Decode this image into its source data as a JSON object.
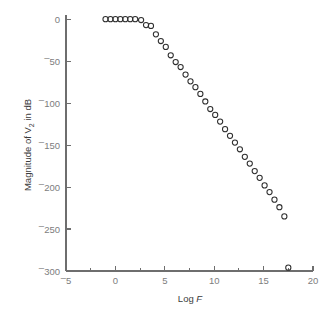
{
  "figure": {
    "background_color": "#ffffff",
    "axis_color": "#6e6e6e",
    "marker_color": "#2e2e2e",
    "tick_label_color": "#7d7d7d"
  },
  "chart_data": {
    "type": "scatter",
    "title": "",
    "xlabel": "Log F",
    "xlabel_plain": "Log",
    "xlabel_italic": "F",
    "ylabel": "Magnitude of V2 in dB",
    "ylabel_prefix": "Magnitude of V",
    "ylabel_subscript": "2",
    "ylabel_suffix": " in dB",
    "xlim": [
      -5,
      20
    ],
    "ylim": [
      -300,
      5
    ],
    "grid": false,
    "legend": false,
    "marker_style": "open-circle",
    "marker_radius_px": 2.6,
    "xticks": [
      -5,
      0,
      5,
      10,
      15,
      20
    ],
    "xtick_labels": [
      "ˉ5",
      "0",
      "5",
      "10",
      "15",
      "20"
    ],
    "xminor_ticks": [
      -2.5,
      2.5,
      7.5,
      12.5,
      17.5
    ],
    "yticks": [
      0,
      -50,
      -100,
      -150,
      -200,
      -250,
      -300
    ],
    "ytick_labels": [
      "0",
      "ˉ50",
      "ˉ100",
      "ˉ150",
      "ˉ200",
      "ˉ250",
      "ˉ300"
    ],
    "x": [
      -1.0,
      -0.5,
      0.0,
      0.5,
      1.0,
      1.5,
      2.0,
      2.6,
      3.1,
      3.6,
      4.1,
      4.6,
      5.1,
      5.6,
      6.1,
      6.6,
      7.1,
      7.6,
      8.1,
      8.6,
      9.1,
      9.6,
      10.1,
      10.6,
      11.1,
      11.6,
      12.1,
      12.6,
      13.1,
      13.6,
      14.1,
      14.6,
      15.1,
      15.6,
      16.1,
      16.6,
      17.1,
      17.5
    ],
    "y": [
      0,
      0,
      0,
      0,
      0,
      0,
      0,
      -1,
      -7,
      -8,
      -18,
      -26,
      -33,
      -43,
      -51,
      -57,
      -66,
      -74,
      -81,
      -89,
      -98,
      -107,
      -114,
      -122,
      -131,
      -139,
      -147,
      -155,
      -164,
      -172,
      -181,
      -189,
      -198,
      -206,
      -215,
      -224,
      -235,
      -296
    ],
    "series_name": "Magnitude response",
    "n_points": 38,
    "annotations": []
  }
}
